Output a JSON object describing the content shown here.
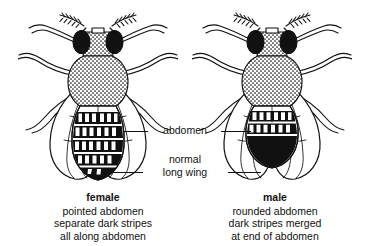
{
  "figure": {
    "background_color": "#ffffff",
    "ink_color": "#111111"
  },
  "center_labels": {
    "abdomen": "abdomen",
    "wing_line1": "normal",
    "wing_line2": "long wing"
  },
  "female": {
    "sex": "female",
    "desc_line1": "pointed abdomen",
    "desc_line2": "separate dark stripes",
    "desc_line3": "all along abdomen"
  },
  "male": {
    "sex": "male",
    "desc_line1": "rounded abdomen",
    "desc_line2": "dark stripes merged",
    "desc_line3": "at end of abdomen"
  }
}
